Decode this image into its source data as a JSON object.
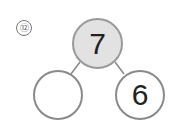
{
  "problem": {
    "number_label": "⑫",
    "whole": "7",
    "part_left": "",
    "part_right": "6"
  },
  "colors": {
    "top_fill": "#e2e2e2",
    "stroke": "#8a8a8a",
    "text": "#222222"
  }
}
